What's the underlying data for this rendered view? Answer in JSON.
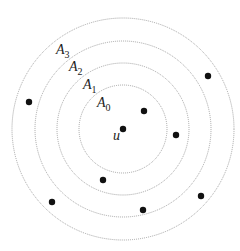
{
  "diagram": {
    "title": "",
    "center": {
      "x": 123,
      "y": 129
    },
    "center_label": "u",
    "rings": [
      {
        "label": "A",
        "subscript": "0",
        "radius": 44,
        "label_x": 97,
        "label_y": 107
      },
      {
        "label": "A",
        "subscript": "1",
        "radius": 66,
        "label_x": 83,
        "label_y": 89
      },
      {
        "label": "A",
        "subscript": "2",
        "radius": 88,
        "label_x": 69,
        "label_y": 71
      },
      {
        "label": "A",
        "subscript": "3",
        "radius": 111,
        "label_x": 56,
        "label_y": 54
      }
    ],
    "points": [
      {
        "x": 123,
        "y": 129
      },
      {
        "x": 144,
        "y": 111
      },
      {
        "x": 176,
        "y": 135
      },
      {
        "x": 208,
        "y": 76
      },
      {
        "x": 29,
        "y": 102
      },
      {
        "x": 103,
        "y": 180
      },
      {
        "x": 52,
        "y": 202
      },
      {
        "x": 143,
        "y": 210
      },
      {
        "x": 201,
        "y": 196
      }
    ],
    "colors": {
      "ring": "#9a9a9a",
      "point": "#111111",
      "text": "#222222"
    }
  }
}
